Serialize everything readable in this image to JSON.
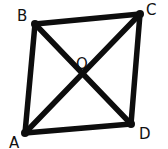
{
  "diagram": {
    "type": "geometry-quadrilateral-with-diagonals",
    "stroke_color": "#0d0d0d",
    "background": "#ffffff",
    "vertices": [
      {
        "name": "A",
        "x": 25,
        "y": 133,
        "label": "A",
        "label_x": 9,
        "label_y": 148
      },
      {
        "name": "B",
        "x": 35,
        "y": 24,
        "label": "B",
        "label_x": 17,
        "label_y": 21
      },
      {
        "name": "C",
        "x": 140,
        "y": 14,
        "label": "C",
        "label_x": 146,
        "label_y": 15
      },
      {
        "name": "D",
        "x": 131,
        "y": 124,
        "label": "D",
        "label_x": 139,
        "label_y": 139
      }
    ],
    "intersection": {
      "name": "O",
      "x": 82,
      "y": 75,
      "label": "O",
      "label_x": 76,
      "label_y": 69
    },
    "edges": [
      {
        "from": "A",
        "to": "B"
      },
      {
        "from": "B",
        "to": "C"
      },
      {
        "from": "C",
        "to": "D"
      },
      {
        "from": "D",
        "to": "A"
      }
    ],
    "diagonals": [
      {
        "from": "A",
        "to": "C"
      },
      {
        "from": "B",
        "to": "D"
      }
    ]
  }
}
